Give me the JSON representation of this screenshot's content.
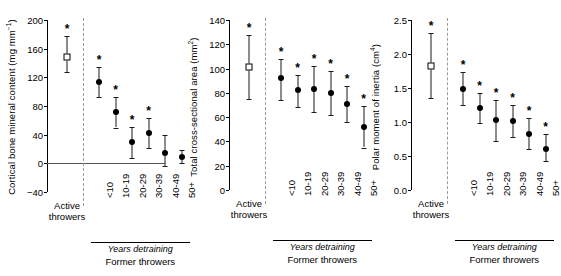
{
  "figure": {
    "panels": [
      {
        "id": "panel-cortical-bmc",
        "ylabel_main": "Cortical bone mineral content (mg mm",
        "ylabel_sup": "−1",
        "ylabel_tail": ")",
        "ylabel_full": "Cortical bone mineral content (mg mm−1)",
        "yticks": [
          "200",
          "160",
          "120",
          "80",
          "40",
          "0",
          "−40"
        ],
        "ymin": -40,
        "ymax": 200,
        "zero_line": true,
        "active": {
          "label": "Active throwers",
          "value": 149,
          "low": 127,
          "high": 178,
          "star": true
        },
        "former": {
          "categories": [
            "<10",
            "10-19",
            "20-29",
            "30-39",
            "40-49",
            "50+"
          ],
          "values": [
            113,
            71,
            30,
            42,
            15,
            9
          ],
          "low": [
            92,
            50,
            8,
            21,
            -4,
            1
          ],
          "high": [
            135,
            93,
            51,
            63,
            39,
            19
          ],
          "stars": [
            true,
            true,
            true,
            true,
            false,
            false
          ]
        },
        "group_caption_italic": "Years detraining",
        "group_caption": "Former throwers"
      },
      {
        "id": "panel-total-csa",
        "ylabel_main": "Total cross-sectional area (mm",
        "ylabel_sup": "2",
        "ylabel_tail": ")",
        "ylabel_full": "Total cross-sectional area (mm2)",
        "yticks": [
          "140",
          "120",
          "100",
          "80",
          "60",
          "40",
          "20",
          "0"
        ],
        "ymin": 0,
        "ymax": 140,
        "zero_line": false,
        "active": {
          "label": "Active throwers",
          "value": 101,
          "low": 75,
          "high": 128,
          "star": true
        },
        "former": {
          "categories": [
            "<10",
            "10-19",
            "20-29",
            "30-39",
            "40-49",
            "50+"
          ],
          "values": [
            92,
            82,
            83,
            80,
            71,
            52
          ],
          "low": [
            74,
            68,
            64,
            62,
            56,
            35
          ],
          "high": [
            108,
            95,
            102,
            98,
            86,
            69
          ],
          "stars": [
            true,
            true,
            true,
            true,
            true,
            true
          ]
        },
        "group_caption_italic": "Years detraining",
        "group_caption": "Former throwers"
      },
      {
        "id": "panel-polar-moment",
        "ylabel_main": "Polar moment of inertia (cm",
        "ylabel_sup": "4",
        "ylabel_tail": ")",
        "ylabel_full": "Polar moment of inertia (cm4)",
        "yticks": [
          "2.5",
          "2.0",
          "1.5",
          "1.0",
          "0.5",
          "0.0"
        ],
        "ymin": 0,
        "ymax": 2.5,
        "zero_line": false,
        "active": {
          "label": "Active throwers",
          "value": 1.82,
          "low": 1.35,
          "high": 2.31,
          "star": true
        },
        "former": {
          "categories": [
            "<10",
            "10-19",
            "20-29",
            "30-39",
            "40-49",
            "50+"
          ],
          "values": [
            1.49,
            1.2,
            1.03,
            1.02,
            0.83,
            0.61
          ],
          "low": [
            1.25,
            0.98,
            0.72,
            0.78,
            0.61,
            0.42
          ],
          "high": [
            1.73,
            1.42,
            1.33,
            1.25,
            1.06,
            0.82
          ],
          "stars": [
            true,
            true,
            true,
            true,
            true,
            true
          ]
        },
        "group_caption_italic": "Years detraining",
        "group_caption": "Former throwers"
      }
    ]
  },
  "chart_data": {
    "type": "scatter",
    "title": "",
    "xlabel": "Years detraining",
    "group_labels": [
      "Active throwers",
      "Former throwers"
    ],
    "categories": [
      "Active throwers",
      "<10",
      "10-19",
      "20-29",
      "30-39",
      "40-49",
      "50+"
    ],
    "panels": [
      {
        "ylabel": "Cortical bone mineral content (mg mm−1)",
        "ylim": [
          -40,
          200
        ],
        "yticks": [
          -40,
          0,
          40,
          80,
          120,
          160,
          200
        ],
        "values": [
          149,
          113,
          71,
          30,
          42,
          15,
          9
        ],
        "ci_low": [
          127,
          92,
          50,
          8,
          21,
          -4,
          1
        ],
        "ci_high": [
          178,
          135,
          93,
          51,
          63,
          39,
          19
        ],
        "significant": [
          true,
          true,
          true,
          true,
          true,
          false,
          false
        ],
        "marker": [
          "open-square",
          "filled-circle",
          "filled-circle",
          "filled-circle",
          "filled-circle",
          "filled-circle",
          "filled-circle"
        ]
      },
      {
        "ylabel": "Total cross-sectional area (mm2)",
        "ylim": [
          0,
          140
        ],
        "yticks": [
          0,
          20,
          40,
          60,
          80,
          100,
          120,
          140
        ],
        "values": [
          101,
          92,
          82,
          83,
          80,
          71,
          52
        ],
        "ci_low": [
          75,
          74,
          68,
          64,
          62,
          56,
          35
        ],
        "ci_high": [
          128,
          108,
          95,
          102,
          98,
          86,
          69
        ],
        "significant": [
          true,
          true,
          true,
          true,
          true,
          true,
          true
        ],
        "marker": [
          "open-square",
          "filled-circle",
          "filled-circle",
          "filled-circle",
          "filled-circle",
          "filled-circle",
          "filled-circle"
        ]
      },
      {
        "ylabel": "Polar moment of inertia (cm4)",
        "ylim": [
          0,
          2.5
        ],
        "yticks": [
          0.0,
          0.5,
          1.0,
          1.5,
          2.0,
          2.5
        ],
        "values": [
          1.82,
          1.49,
          1.2,
          1.03,
          1.02,
          0.83,
          0.61
        ],
        "ci_low": [
          1.35,
          1.25,
          0.98,
          0.72,
          0.78,
          0.61,
          0.42
        ],
        "ci_high": [
          2.31,
          1.73,
          1.42,
          1.33,
          1.25,
          1.06,
          0.82
        ],
        "significant": [
          true,
          true,
          true,
          true,
          true,
          true,
          true
        ],
        "marker": [
          "open-square",
          "filled-circle",
          "filled-circle",
          "filled-circle",
          "filled-circle",
          "filled-circle",
          "filled-circle"
        ]
      }
    ],
    "grid": false,
    "legend": "none",
    "annotations": [
      "*",
      "Years detraining",
      "Former throwers",
      "Active throwers"
    ]
  }
}
